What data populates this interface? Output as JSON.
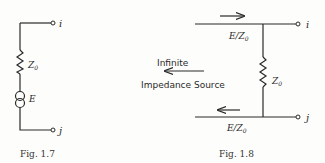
{
  "figures": [
    {
      "caption": "Fig. 1.7",
      "terminal_top": "i",
      "terminal_bottom": "j",
      "impedance_label": "Z",
      "impedance_sub": "0",
      "source_label": "E"
    },
    {
      "caption": "Fig. 1.8",
      "terminal_top": "i",
      "terminal_bottom": "j",
      "impedance_label": "Z",
      "impedance_sub": "0",
      "current_top": "E/Z",
      "current_top_sub": "0",
      "current_bottom": "E/Z",
      "current_bottom_sub": "0",
      "source_line1": "Infinite",
      "source_line2": "Impedance Source"
    }
  ]
}
